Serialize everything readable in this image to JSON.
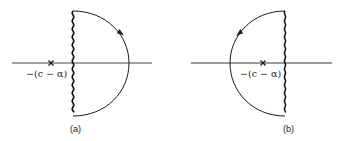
{
  "figure": {
    "panels": [
      {
        "id": "a",
        "caption": "(a)",
        "pole_label": "−(c − α)",
        "pole_marker": "×",
        "contour": "semicircle closed to the right of a wavy vertical line",
        "arrow_direction": "clockwise"
      },
      {
        "id": "b",
        "caption": "(b)",
        "pole_label": "−(c − α)",
        "pole_marker": "×",
        "contour": "semicircle closed to the left of a wavy vertical line",
        "arrow_direction": "counterclockwise"
      }
    ],
    "colors": {
      "stroke": "#1a1a1a",
      "axis": "#333333",
      "background": "#ffffff"
    }
  }
}
